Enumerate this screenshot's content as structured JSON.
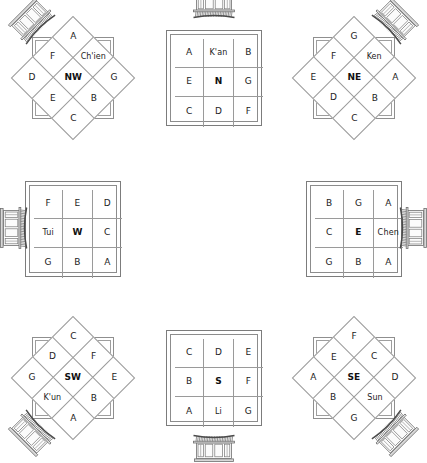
{
  "figure": {
    "stroke_color": "#8f8f8f",
    "text_color": "#222222",
    "background": "#ffffff"
  },
  "panels": [
    {
      "id": "nw",
      "shape": "diamond",
      "center_label": "NW",
      "trigram": "Ch'ien",
      "gate_position": "upper-left",
      "gate_rotation_deg": -45,
      "cells": [
        "A",
        "Ch'ien",
        "G",
        "F",
        "NW",
        "B",
        "D",
        "E",
        "C"
      ]
    },
    {
      "id": "n",
      "shape": "square",
      "center_label": "N",
      "trigram": "K'an",
      "gate_position": "top",
      "gate_rotation_deg": 0,
      "cells": [
        "A",
        "K'an",
        "B",
        "E",
        "N",
        "G",
        "C",
        "D",
        "F"
      ]
    },
    {
      "id": "ne",
      "shape": "diamond",
      "center_label": "NE",
      "trigram": "Ken",
      "gate_position": "upper-right",
      "gate_rotation_deg": 45,
      "cells": [
        "G",
        "Ken",
        "A",
        "F",
        "NE",
        "B",
        "E",
        "D",
        "C"
      ]
    },
    {
      "id": "w",
      "shape": "square",
      "center_label": "W",
      "trigram": "Tui",
      "gate_position": "left",
      "gate_rotation_deg": -90,
      "cells": [
        "F",
        "E",
        "D",
        "Tui",
        "W",
        "C",
        "G",
        "B",
        "A"
      ]
    },
    {
      "id": "center",
      "shape": "none",
      "center_label": "",
      "trigram": "",
      "gate_position": "none",
      "gate_rotation_deg": 0,
      "cells": []
    },
    {
      "id": "e",
      "shape": "square",
      "center_label": "E",
      "trigram": "Chen",
      "gate_position": "right",
      "gate_rotation_deg": 90,
      "cells": [
        "B",
        "G",
        "A",
        "C",
        "E",
        "Chen",
        "G",
        "B",
        "A"
      ]
    },
    {
      "id": "sw",
      "shape": "diamond",
      "center_label": "SW",
      "trigram": "K'un",
      "gate_position": "lower-left",
      "gate_rotation_deg": -135,
      "cells": [
        "C",
        "F",
        "E",
        "D",
        "SW",
        "B",
        "G",
        "K'un",
        "A"
      ]
    },
    {
      "id": "s",
      "shape": "square",
      "center_label": "S",
      "trigram": "Li",
      "gate_position": "bottom",
      "gate_rotation_deg": 180,
      "cells": [
        "C",
        "D",
        "E",
        "B",
        "S",
        "F",
        "A",
        "Li",
        "G"
      ]
    },
    {
      "id": "se",
      "shape": "diamond",
      "center_label": "SE",
      "trigram": "Sun",
      "gate_position": "lower-right",
      "gate_rotation_deg": 135,
      "cells": [
        "F",
        "C",
        "D",
        "E",
        "SE",
        "Sun",
        "A",
        "B",
        "G"
      ]
    }
  ]
}
